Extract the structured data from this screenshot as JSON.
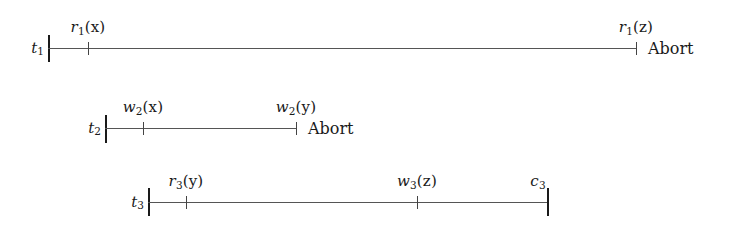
{
  "figure": {
    "background_color": "#ffffff",
    "line_color": "#555555",
    "bar_color": "#1a1a1a",
    "text_color": "#1a1a1a",
    "width": 735,
    "height": 247
  },
  "transactions": [
    {
      "id": "t1",
      "name_base": "t",
      "name_sub": "1",
      "axis": {
        "x_start": 48,
        "x_end": 636,
        "y": 48
      },
      "start_bar": {
        "x": 48,
        "y_top": 35,
        "y_bottom": 62
      },
      "operations": [
        {
          "id": "r1x",
          "op_base": "r",
          "op_sub": "1",
          "op_arg": "(x)",
          "label": "r1(x)",
          "tick_x": 88,
          "label_x": 88,
          "label_y": 18
        },
        {
          "id": "r1z",
          "op_base": "r",
          "op_sub": "1",
          "op_arg": "(z)",
          "label": "r1(z)",
          "tick_x": 636,
          "label_x": 636,
          "label_y": 18
        }
      ],
      "terminal": {
        "text": "Abort",
        "x": 648,
        "y": 48
      }
    },
    {
      "id": "t2",
      "name_base": "t",
      "name_sub": "2",
      "axis": {
        "x_start": 105,
        "x_end": 296,
        "y": 128
      },
      "start_bar": {
        "x": 105,
        "y_top": 115,
        "y_bottom": 143
      },
      "operations": [
        {
          "id": "w2x",
          "op_base": "w",
          "op_sub": "2",
          "op_arg": "(x)",
          "label": "w2(x)",
          "tick_x": 143,
          "label_x": 143,
          "label_y": 98
        },
        {
          "id": "w2y",
          "op_base": "w",
          "op_sub": "2",
          "op_arg": "(y)",
          "label": "w2(y)",
          "tick_x": 296,
          "label_x": 296,
          "label_y": 98
        }
      ],
      "terminal": {
        "text": "Abort",
        "x": 308,
        "y": 128
      }
    },
    {
      "id": "t3",
      "name_base": "t",
      "name_sub": "3",
      "axis": {
        "x_start": 148,
        "x_end": 547,
        "y": 202
      },
      "start_bar": {
        "x": 148,
        "y_top": 188,
        "y_bottom": 216
      },
      "operations": [
        {
          "id": "r3y",
          "op_base": "r",
          "op_sub": "3",
          "op_arg": "(y)",
          "label": "r3(y)",
          "tick_x": 186,
          "label_x": 186,
          "label_y": 172
        },
        {
          "id": "w3z",
          "op_base": "w",
          "op_sub": "3",
          "op_arg": "(z)",
          "label": "w3(z)",
          "tick_x": 417,
          "label_x": 417,
          "label_y": 172
        }
      ],
      "commit": {
        "id": "c3",
        "op_base": "c",
        "op_sub": "3",
        "op_arg": "",
        "label": "c3",
        "bar_x": 547,
        "bar_y_top": 188,
        "bar_y_bottom": 216,
        "label_x": 538,
        "label_y": 172
      },
      "terminal": null
    }
  ]
}
